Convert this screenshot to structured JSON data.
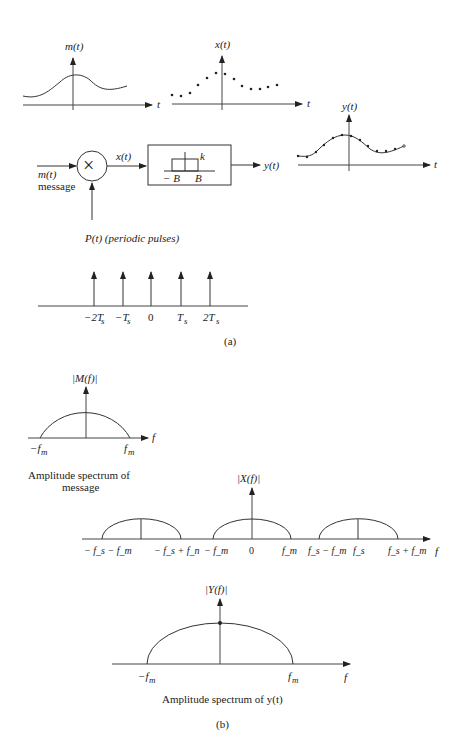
{
  "part_a": {
    "m_plot": {
      "ylabel": "m(t)",
      "xlabel": "t"
    },
    "x_plot": {
      "ylabel": "x(t)",
      "xlabel": "t"
    },
    "y_plot": {
      "ylabel": "y(t)",
      "xlabel": "t"
    },
    "block": {
      "input_label": "m(t)",
      "input_sub": "message",
      "multiplier_symbol": "×",
      "mult_output": "x(t)",
      "filter_gain": "k",
      "filter_neg_b": "− B",
      "filter_pos_b": "B",
      "output_label": "y(t)",
      "pulse_label": "P(t) (periodic pulses)"
    },
    "pulses": {
      "ticks": [
        "−2T",
        "−T",
        "0",
        "T",
        "2T"
      ],
      "subs": [
        "s",
        "s",
        "",
        "s",
        "s"
      ]
    },
    "caption": "(a)"
  },
  "part_b": {
    "M_spec": {
      "ylabel": "|M(f)|",
      "xlabel": "f",
      "left": "−f",
      "right": "f",
      "sub": "m",
      "caption_line1": "Amplitude spectrum of",
      "caption_line2": "message"
    },
    "X_spec": {
      "ylabel": "|X(f)|",
      "xlabel": "f",
      "ticks": [
        "− f_s − f_m",
        "− f_s + f_n",
        "− f_m",
        "0",
        "f_m",
        "f_s − f_m",
        "f_s",
        "f_s + f_m"
      ]
    },
    "Y_spec": {
      "ylabel": "|Y(f)|",
      "xlabel": "f",
      "left": "−f",
      "right": "f",
      "sub": "m",
      "caption": "Amplitude spectrum of y(t)"
    },
    "caption": "(b)"
  }
}
